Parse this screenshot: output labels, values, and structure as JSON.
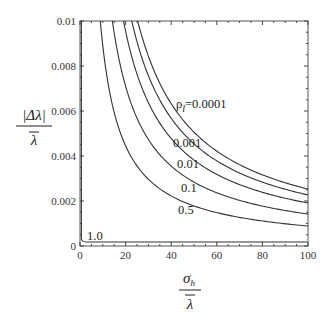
{
  "chart_data": {
    "type": "line",
    "title": "",
    "xlabel": "σ_h / λ̄",
    "ylabel": "|Δλ| / λ̄",
    "xlim": [
      0,
      100
    ],
    "ylim": [
      0,
      0.01
    ],
    "x_ticks": [
      0,
      20,
      40,
      60,
      80,
      100
    ],
    "x_tick_labels": [
      "0",
      "20",
      "40",
      "60",
      "80",
      "100"
    ],
    "y_ticks": [
      0,
      0.002,
      0.004,
      0.006,
      0.008,
      0.01
    ],
    "y_tick_labels": [
      "0",
      "0.002",
      "0.004",
      "0.006",
      "0.008",
      "0.01"
    ],
    "grid": false,
    "legend": "inline curve labels",
    "series": [
      {
        "name": "ρ_l=0.0001",
        "label": "ρl=0.0001",
        "coef": 0.253,
        "x": [
          25.3,
          30,
          40,
          50,
          60,
          70,
          80,
          90,
          100
        ],
        "values": [
          0.01,
          0.00843,
          0.00633,
          0.00506,
          0.00422,
          0.00361,
          0.00316,
          0.00281,
          0.00253
        ]
      },
      {
        "name": "ρ_l=0.001",
        "label": "0.001",
        "coef": 0.227,
        "x": [
          22.7,
          30,
          40,
          50,
          60,
          70,
          80,
          90,
          100
        ],
        "values": [
          0.01,
          0.00757,
          0.00568,
          0.00454,
          0.00378,
          0.00324,
          0.00284,
          0.00252,
          0.00227
        ]
      },
      {
        "name": "ρ_l=0.01",
        "label": "0.01",
        "coef": 0.191,
        "x": [
          19.1,
          30,
          40,
          50,
          60,
          70,
          80,
          90,
          100
        ],
        "values": [
          0.01,
          0.00637,
          0.00478,
          0.00382,
          0.00318,
          0.00273,
          0.00239,
          0.00212,
          0.00191
        ]
      },
      {
        "name": "ρ_l=0.1",
        "label": "0.1",
        "coef": 0.142,
        "x": [
          14.2,
          20,
          30,
          40,
          50,
          60,
          70,
          80,
          90,
          100
        ],
        "values": [
          0.01,
          0.0071,
          0.00473,
          0.00355,
          0.00284,
          0.00237,
          0.00203,
          0.00178,
          0.00158,
          0.00142
        ]
      },
      {
        "name": "ρ_l=0.5",
        "label": "0.5",
        "coef": 0.089,
        "x": [
          8.9,
          10,
          20,
          30,
          40,
          50,
          60,
          70,
          80,
          90,
          100
        ],
        "values": [
          0.01,
          0.0089,
          0.00445,
          0.00297,
          0.00223,
          0.00178,
          0.00148,
          0.00127,
          0.00111,
          0.00099,
          0.00089
        ]
      },
      {
        "name": "ρ_l=1.0",
        "label": "1.0",
        "x": [
          0.5,
          1,
          2,
          5,
          20,
          40,
          60,
          80,
          100
        ],
        "values": [
          0.01,
          0.0006,
          0.0002,
          0.00018,
          0.00018,
          0.00018,
          0.00018,
          0.00018,
          0.00018
        ]
      }
    ],
    "annotations": [
      "ρl=0.0001",
      "0.001",
      "0.01",
      "0.1",
      "0.5",
      "1.0"
    ]
  },
  "labels": {
    "y_num": "|Δλ|",
    "y_den": "λ",
    "x_num": "σ",
    "x_sub": "h",
    "x_den": "λ",
    "rho": "ρ",
    "rho_sub": "l",
    "rho_val": "=0.0001",
    "c2": "0.001",
    "c3": "0.01",
    "c4": "0.1",
    "c5": "0.5",
    "c6": "1.0"
  }
}
